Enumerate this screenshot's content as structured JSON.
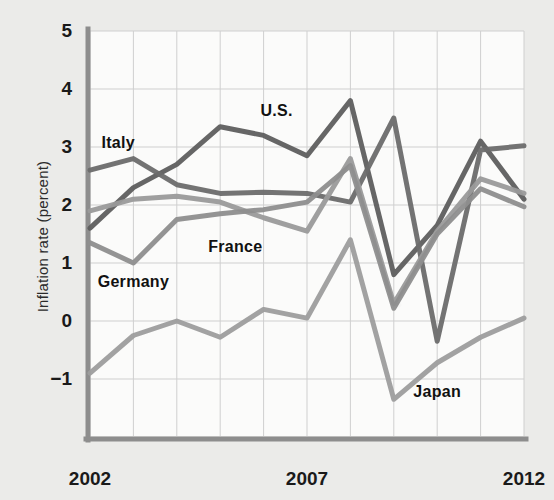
{
  "chart_data": {
    "type": "line",
    "title": "",
    "subtitle": "",
    "xlabel": "",
    "ylabel": "Inflation rate (percent)",
    "xlim": [
      2002,
      2012
    ],
    "ylim": [
      -1.6,
      5
    ],
    "ytick_values": [
      5,
      4,
      3,
      2,
      1,
      0,
      -1
    ],
    "ytick_labels": [
      "5",
      "4",
      "3",
      "2",
      "1",
      "0",
      "−1"
    ],
    "xtick_values": [
      2002,
      2007,
      2012
    ],
    "xtick_labels": [
      "2002",
      "2007",
      "2012"
    ],
    "x": [
      2002,
      2003,
      2004,
      2005,
      2006,
      2007,
      2008,
      2009,
      2010,
      2011,
      2012
    ],
    "grid": true,
    "legend": "inline-labels",
    "series": [
      {
        "name": "U.S.",
        "color": "#5e5e5e",
        "values": [
          1.6,
          2.3,
          2.7,
          3.35,
          3.2,
          2.85,
          3.8,
          0.8,
          1.65,
          3.1,
          2.1
        ],
        "label_x": 2006.3,
        "label_y": 3.62
      },
      {
        "name": "Italy",
        "color": "#6b6b6b",
        "values": [
          2.6,
          2.8,
          2.35,
          2.2,
          2.22,
          2.2,
          2.05,
          3.5,
          -0.35,
          2.95,
          3.02
        ],
        "label_x": 2002.65,
        "label_y": 3.07
      },
      {
        "name": "France",
        "color": "#9a9a9a",
        "values": [
          1.9,
          2.1,
          2.15,
          2.05,
          1.78,
          1.55,
          2.8,
          0.3,
          1.55,
          2.45,
          2.2
        ],
        "label_x": 2005.35,
        "label_y": 1.27
      },
      {
        "name": "Germany",
        "color": "#8e8e8e",
        "values": [
          1.35,
          1.0,
          1.75,
          1.85,
          1.92,
          2.05,
          2.68,
          0.22,
          1.5,
          2.28,
          1.97
        ],
        "label_x": 2003.0,
        "label_y": 0.67
      },
      {
        "name": "Japan",
        "color": "#9d9d9d",
        "values": [
          -0.9,
          -0.25,
          0.0,
          -0.28,
          0.2,
          0.05,
          1.4,
          -1.35,
          -0.72,
          -0.28,
          0.05
        ],
        "label_x": 2010.0,
        "label_y": -1.22
      }
    ],
    "colors": {
      "background": "#ebebe9",
      "plot_background": "#fbfbfa",
      "grid": "#cfcfcf",
      "axis": "#8d8d8d",
      "text": "#1a1a1a"
    }
  }
}
